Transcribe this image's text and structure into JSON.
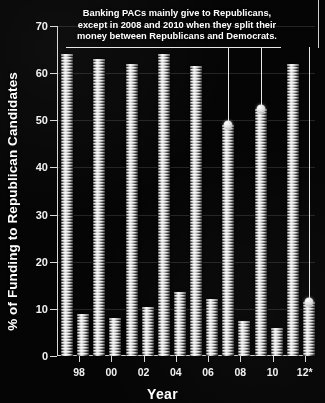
{
  "chart_data": {
    "type": "bar",
    "title": "",
    "xlabel": "Year",
    "ylabel": "% of Funding to Republican Candidates",
    "categories": [
      "98",
      "00",
      "02",
      "04",
      "06",
      "08",
      "10",
      "12*"
    ],
    "ylim": [
      0,
      70
    ],
    "yticks": [
      0,
      10,
      20,
      30,
      40,
      50,
      60,
      70
    ],
    "grid": true,
    "legend": "none",
    "series": [
      {
        "name": "Republican share",
        "values": [
          64,
          63,
          62,
          64,
          61.5,
          49,
          52.5,
          62
        ]
      },
      {
        "name": "Democratic share",
        "values": [
          9,
          8,
          10.5,
          13.5,
          12,
          7.5,
          6,
          11.5
        ]
      }
    ],
    "annotations": [
      {
        "text": "Banking PACs mainly give to Republicans, except in 2008 and 2010 when they split their money between Republicans and Democrats.",
        "markers": [
          {
            "category": "08",
            "value": 49
          },
          {
            "category": "10",
            "value": 52.5
          },
          {
            "category": "12*",
            "value": 11.5
          }
        ]
      }
    ]
  },
  "axes": {
    "y_title": "% of Funding to Republican Candidates",
    "x_title": "Year",
    "y_tick_labels": [
      "0",
      "10",
      "20",
      "30",
      "40",
      "50",
      "60",
      "70"
    ],
    "x_tick_labels": [
      "98",
      "00",
      "02",
      "04",
      "06",
      "08",
      "10",
      "12*"
    ]
  },
  "annotation": {
    "line1": "Banking PACs mainly give to Republicans,",
    "line2": "except in 2008 and 2010 when they split their",
    "line3": "money between Republicans and Democrats."
  },
  "colors": {
    "background": "#050505",
    "axis": "#d8d8d8",
    "text": "#ffffff",
    "bar_light": "#f2f2f2",
    "bar_dark": "#232323",
    "marker": "#ffffff"
  }
}
